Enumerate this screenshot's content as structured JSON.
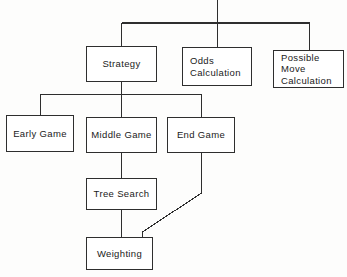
{
  "diagram": {
    "type": "hierarchy-tree",
    "background_color": "#fdfdfc",
    "line_color": "#2e2e2e",
    "text_color": "#1a1a1a",
    "root_label": "",
    "nodes": [
      {
        "id": "strategy",
        "label": "Strategy",
        "align": "center",
        "level": 1,
        "x": 86,
        "y": 46,
        "w": 71,
        "h": 36
      },
      {
        "id": "odds-calculation",
        "label": "Odds\nCalculation",
        "align": "left",
        "level": 1,
        "x": 182,
        "y": 47,
        "w": 70,
        "h": 39
      },
      {
        "id": "possible-move-calculation",
        "label": "Possible  Move\nCalculation",
        "align": "left",
        "level": 1,
        "x": 273,
        "y": 50,
        "w": 71,
        "h": 38
      },
      {
        "id": "early-game",
        "label": "Early Game",
        "align": "center",
        "level": 2,
        "x": 6,
        "y": 115,
        "w": 68,
        "h": 37
      },
      {
        "id": "middle-game",
        "label": "Middle Game",
        "align": "center",
        "level": 2,
        "x": 86,
        "y": 117,
        "w": 71,
        "h": 36
      },
      {
        "id": "end-game",
        "label": "End Game",
        "align": "center",
        "level": 2,
        "x": 167,
        "y": 117,
        "w": 68,
        "h": 36
      },
      {
        "id": "tree-search",
        "label": "Tree Search",
        "align": "center",
        "level": 3,
        "x": 86,
        "y": 178,
        "w": 71,
        "h": 32
      },
      {
        "id": "weighting",
        "label": "Weighting",
        "align": "center",
        "level": 4,
        "x": 86,
        "y": 237,
        "w": 67,
        "h": 33
      }
    ],
    "edges": [
      {
        "from": "root",
        "to": "strategy"
      },
      {
        "from": "root",
        "to": "odds-calculation"
      },
      {
        "from": "root",
        "to": "possible-move-calculation"
      },
      {
        "from": "strategy",
        "to": "early-game"
      },
      {
        "from": "strategy",
        "to": "middle-game"
      },
      {
        "from": "strategy",
        "to": "end-game"
      },
      {
        "from": "middle-game",
        "to": "tree-search"
      },
      {
        "from": "tree-search",
        "to": "weighting"
      },
      {
        "from": "end-game",
        "to": "weighting"
      }
    ]
  }
}
